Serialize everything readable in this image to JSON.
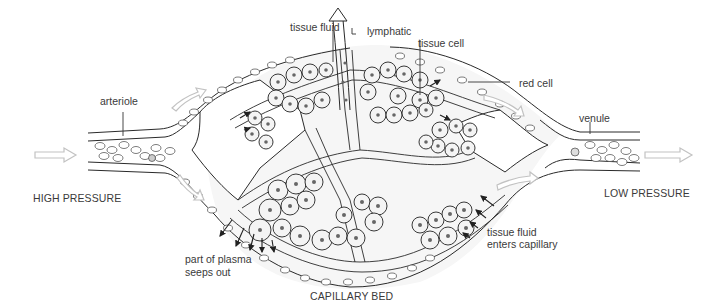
{
  "title": "CAPILLARY BED",
  "labels": {
    "tissue_fluid": "tissue fluid",
    "lymphatic": "lymphatic",
    "tissue_cell": "tissue cell",
    "red_cell": "red cell",
    "arteriole": "arteriole",
    "venule": "venule",
    "high_pressure": "HIGH PRESSURE",
    "low_pressure": "LOW PRESSURE",
    "plasma_line1": "part of plasma",
    "plasma_line2": "seeps out",
    "fluid_enters_line1": "tissue fluid",
    "fluid_enters_line2": "enters capillary"
  },
  "colors": {
    "line": "#2a2a2a",
    "arrow_flow": "#c8c8c8",
    "cell_fill": "#f2f2f2",
    "nucleus": "#777777",
    "background": "#ffffff"
  }
}
